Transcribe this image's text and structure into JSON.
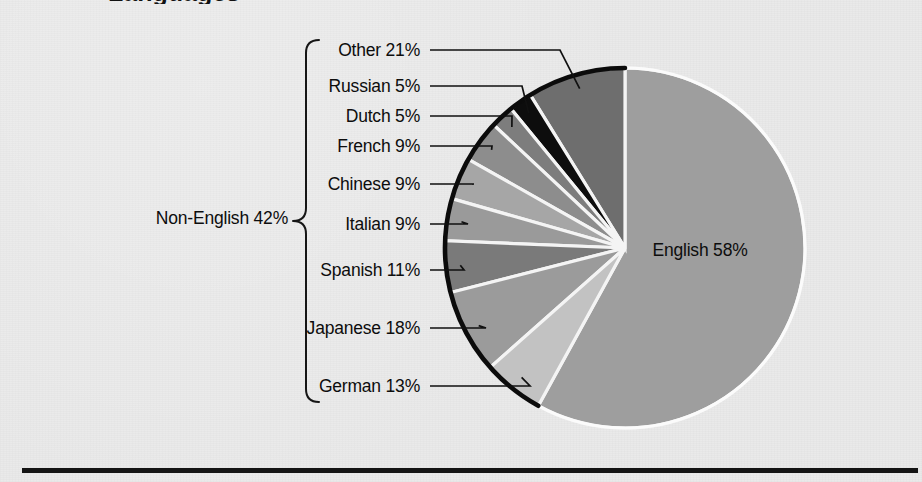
{
  "figure": {
    "cut_off_title": "Languages",
    "background_color": "#e9e9e9",
    "rule_color": "#141414"
  },
  "chart_data": {
    "type": "pie",
    "title": "",
    "subtitle": "",
    "xlabel": "",
    "ylabel": "",
    "legend_position": "left-callouts",
    "grid": false,
    "start_angle_deg": 0,
    "note": "English占整体58%，其余为Non-English 42%的内部占比；Non-English细分从12点钟方向逆时针排列。",
    "categories": [
      "English",
      "Other",
      "Russian",
      "Dutch",
      "French",
      "Chinese",
      "Italian",
      "Spanish",
      "Japanese",
      "German"
    ],
    "values": [
      58,
      21,
      5,
      5,
      9,
      9,
      9,
      11,
      18,
      13
    ],
    "labels": [
      "English 58%",
      "Other 21%",
      "Russian 5%",
      "Dutch 5%",
      "French 9%",
      "Chinese 9%",
      "Italian 9%",
      "Spanish 11%",
      "Japanese 18%",
      "German 13%"
    ],
    "group_label": "Non-English 42%",
    "group_value": 42,
    "colors": [
      "#9e9e9e",
      "#6e6e6e",
      "#0d0d0d",
      "#7d7d7d",
      "#8d8d8d",
      "#a6a6a6",
      "#9a9a9a",
      "#7a7a7a",
      "#9b9b9b",
      "#c2c2c2"
    ]
  },
  "pie": {
    "center_x": 625,
    "center_y": 248,
    "radius": 180,
    "inner_label": {
      "text": "English 58%",
      "x": 700,
      "y": 256
    }
  },
  "callouts": [
    {
      "id": "other",
      "text": "Other 21%",
      "text_x": 420,
      "text_y": 56,
      "line_x1": 430,
      "line_y1": 50,
      "line_x2": 560,
      "line_y2": 50,
      "tip_x": 597,
      "tip_y": 100
    },
    {
      "id": "russian",
      "text": "Russian 5%",
      "text_x": 420,
      "text_y": 92,
      "line_x1": 430,
      "line_y1": 86,
      "line_x2": 522,
      "line_y2": 86,
      "tip_x": 545,
      "tip_y": 112
    },
    {
      "id": "dutch",
      "text": "Dutch 5%",
      "text_x": 420,
      "text_y": 122,
      "line_x1": 430,
      "line_y1": 116,
      "line_x2": 512,
      "line_y2": 116,
      "tip_x": 524,
      "tip_y": 128
    },
    {
      "id": "french",
      "text": "French 9%",
      "text_x": 420,
      "text_y": 152,
      "line_x1": 430,
      "line_y1": 146,
      "line_x2": 492,
      "line_y2": 146,
      "tip_x": 500,
      "tip_y": 152
    },
    {
      "id": "chinese",
      "text": "Chinese 9%",
      "text_x": 420,
      "text_y": 190,
      "line_x1": 430,
      "line_y1": 184,
      "line_x2": 474,
      "line_y2": 184,
      "tip_x": 481,
      "tip_y": 190
    },
    {
      "id": "italian",
      "text": "Italian 9%",
      "text_x": 420,
      "text_y": 230,
      "line_x1": 430,
      "line_y1": 224,
      "line_x2": 468,
      "line_y2": 224,
      "tip_x": 468,
      "tip_y": 224
    },
    {
      "id": "spanish",
      "text": "Spanish 11%",
      "text_x": 420,
      "text_y": 276,
      "line_x1": 430,
      "line_y1": 270,
      "line_x2": 464,
      "line_y2": 270,
      "tip_x": 464,
      "tip_y": 270
    },
    {
      "id": "japanese",
      "text": "Japanese 18%",
      "text_x": 420,
      "text_y": 334,
      "line_x1": 430,
      "line_y1": 328,
      "line_x2": 486,
      "line_y2": 328,
      "tip_x": 486,
      "tip_y": 328
    },
    {
      "id": "german",
      "text": "German 13%",
      "text_x": 420,
      "text_y": 392,
      "line_x1": 430,
      "line_y1": 386,
      "line_x2": 530,
      "line_y2": 386,
      "tip_x": 530,
      "tip_y": 386
    }
  ],
  "brace": {
    "label": "Non-English 42%",
    "label_x": 288,
    "label_y": 224,
    "x": 306,
    "top_y": 40,
    "bottom_y": 402
  }
}
